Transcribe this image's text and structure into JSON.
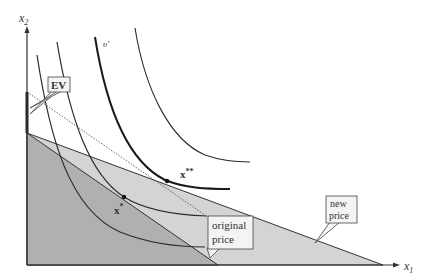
{
  "diagram": {
    "axes": {
      "x_label": "x",
      "x_sub": "1",
      "y_label": "x",
      "y_sub": "2"
    },
    "labels": {
      "ev": "EV",
      "u_prime": "υ′",
      "x_star": "x",
      "x_star_sup": "*",
      "x_double_star": "x",
      "x_double_star_sup": "**",
      "original_price_line1": "original",
      "original_price_line2": "price",
      "new_price_line1": "new",
      "new_price_line2": "price"
    },
    "colors": {
      "axis": "#333333",
      "original_fill": "#b0b0b0",
      "new_fill": "#d4d4d4",
      "curve": "#2a2a2a",
      "callout_bg": "#f4f4f4"
    }
  }
}
